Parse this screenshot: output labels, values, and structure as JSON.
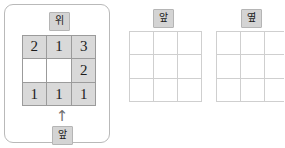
{
  "panels": {
    "left": {
      "top_label": "위",
      "bottom_label": "앞",
      "arrow_icon": "↑",
      "grid": {
        "rows": [
          [
            {
              "value": "2",
              "state": "filled"
            },
            {
              "value": "1",
              "state": "filled"
            },
            {
              "value": "3",
              "state": "filled"
            }
          ],
          [
            {
              "value": "",
              "state": "empty"
            },
            {
              "value": "",
              "state": "empty"
            },
            {
              "value": "2",
              "state": "filled"
            }
          ],
          [
            {
              "value": "1",
              "state": "filled"
            },
            {
              "value": "1",
              "state": "filled"
            },
            {
              "value": "1",
              "state": "filled"
            }
          ]
        ]
      }
    },
    "front": {
      "label": "앞",
      "grid": {
        "rows": [
          [
            {
              "value": ""
            },
            {
              "value": ""
            },
            {
              "value": ""
            }
          ],
          [
            {
              "value": ""
            },
            {
              "value": ""
            },
            {
              "value": ""
            }
          ],
          [
            {
              "value": ""
            },
            {
              "value": ""
            },
            {
              "value": ""
            }
          ]
        ]
      }
    },
    "side": {
      "label": "옆",
      "grid": {
        "rows": [
          [
            {
              "value": ""
            },
            {
              "value": ""
            },
            {
              "value": ""
            }
          ],
          [
            {
              "value": ""
            },
            {
              "value": ""
            },
            {
              "value": ""
            }
          ],
          [
            {
              "value": ""
            },
            {
              "value": ""
            },
            {
              "value": ""
            }
          ]
        ]
      }
    }
  },
  "colors": {
    "cell_fill": "#d9d9d9",
    "cell_border": "#9b9b9b",
    "badge_fill": "#d4d4d4",
    "badge_border": "#b5b5b5",
    "card_border": "#b9b9b9",
    "empty_grid_border": "#cfcfcf",
    "arrow": "#6d6d6d"
  }
}
